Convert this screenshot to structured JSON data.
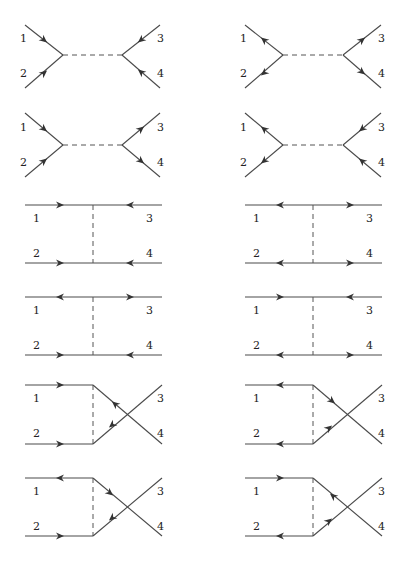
{
  "figure": {
    "width": 403,
    "height": 564,
    "colors": {
      "line": "#4a4a4a",
      "arrow": "#333333",
      "label": "#222222"
    },
    "diagrams": [
      {
        "id": "s-left-1",
        "channel": "s",
        "lines": [
          [
            25,
            25,
            63,
            55
          ],
          [
            25,
            88,
            63,
            55
          ],
          [
            63,
            55,
            122,
            55,
            "dash"
          ],
          [
            122,
            55,
            160,
            25
          ],
          [
            122,
            55,
            160,
            88
          ]
        ],
        "arrows": [
          [
            44,
            40,
            1,
            1
          ],
          [
            44,
            73,
            1,
            -1
          ],
          [
            141,
            40,
            -1,
            1
          ],
          [
            141,
            72,
            -1,
            -1
          ]
        ],
        "labels": [
          {
            "t": "1",
            "x": 20,
            "y": 42
          },
          {
            "t": "2",
            "x": 20,
            "y": 77
          },
          {
            "t": "3",
            "x": 157,
            "y": 42
          },
          {
            "t": "4",
            "x": 157,
            "y": 77
          }
        ]
      },
      {
        "id": "s-right-1",
        "channel": "s",
        "lines": [
          [
            245,
            25,
            283,
            55
          ],
          [
            245,
            88,
            283,
            55
          ],
          [
            283,
            55,
            343,
            55,
            "dash"
          ],
          [
            343,
            55,
            381,
            25
          ],
          [
            343,
            55,
            381,
            88
          ]
        ],
        "arrows": [
          [
            264,
            40,
            -1,
            -1
          ],
          [
            264,
            73,
            -1,
            1
          ],
          [
            362,
            40,
            1,
            -1
          ],
          [
            362,
            72,
            1,
            1
          ]
        ],
        "labels": [
          {
            "t": "1",
            "x": 240,
            "y": 42
          },
          {
            "t": "2",
            "x": 240,
            "y": 77
          },
          {
            "t": "3",
            "x": 378,
            "y": 42
          },
          {
            "t": "4",
            "x": 378,
            "y": 77
          }
        ]
      },
      {
        "id": "s-left-2",
        "channel": "s",
        "lines": [
          [
            25,
            113,
            63,
            145
          ],
          [
            25,
            177,
            63,
            145
          ],
          [
            63,
            145,
            122,
            145,
            "dash"
          ],
          [
            122,
            145,
            160,
            113
          ],
          [
            122,
            145,
            160,
            177
          ]
        ],
        "arrows": [
          [
            44,
            129,
            1,
            1
          ],
          [
            44,
            161,
            1,
            -1
          ],
          [
            141,
            129,
            1,
            -1
          ],
          [
            141,
            161,
            1,
            1
          ]
        ],
        "labels": [
          {
            "t": "1",
            "x": 20,
            "y": 131
          },
          {
            "t": "2",
            "x": 20,
            "y": 166
          },
          {
            "t": "3",
            "x": 157,
            "y": 131
          },
          {
            "t": "4",
            "x": 157,
            "y": 166
          }
        ]
      },
      {
        "id": "s-right-2",
        "channel": "s",
        "lines": [
          [
            245,
            113,
            283,
            145
          ],
          [
            245,
            177,
            283,
            145
          ],
          [
            283,
            145,
            343,
            145,
            "dash"
          ],
          [
            343,
            145,
            381,
            113
          ],
          [
            343,
            145,
            381,
            177
          ]
        ],
        "arrows": [
          [
            264,
            129,
            -1,
            -1
          ],
          [
            264,
            161,
            -1,
            1
          ],
          [
            362,
            129,
            -1,
            1
          ],
          [
            362,
            161,
            -1,
            -1
          ]
        ],
        "labels": [
          {
            "t": "1",
            "x": 240,
            "y": 131
          },
          {
            "t": "2",
            "x": 240,
            "y": 166
          },
          {
            "t": "3",
            "x": 378,
            "y": 131
          },
          {
            "t": "4",
            "x": 378,
            "y": 166
          }
        ]
      },
      {
        "id": "t-left-1",
        "channel": "t",
        "lines": [
          [
            25,
            205,
            162,
            205
          ],
          [
            25,
            263,
            162,
            263
          ],
          [
            93,
            205,
            93,
            263,
            "dash"
          ]
        ],
        "harrows": [
          [
            60,
            205,
            1
          ],
          [
            130,
            205,
            -1
          ],
          [
            60,
            263,
            1
          ],
          [
            130,
            263,
            -1
          ]
        ],
        "labels": [
          {
            "t": "1",
            "x": 33,
            "y": 222
          },
          {
            "t": "3",
            "x": 146,
            "y": 222
          },
          {
            "t": "2",
            "x": 33,
            "y": 257
          },
          {
            "t": "4",
            "x": 146,
            "y": 257
          }
        ]
      },
      {
        "id": "t-right-1",
        "channel": "t",
        "lines": [
          [
            245,
            205,
            382,
            205
          ],
          [
            245,
            263,
            382,
            263
          ],
          [
            313,
            205,
            313,
            263,
            "dash"
          ]
        ],
        "harrows": [
          [
            280,
            205,
            -1
          ],
          [
            350,
            205,
            1
          ],
          [
            280,
            263,
            -1
          ],
          [
            350,
            263,
            1
          ]
        ],
        "labels": [
          {
            "t": "1",
            "x": 253,
            "y": 222
          },
          {
            "t": "3",
            "x": 366,
            "y": 222
          },
          {
            "t": "2",
            "x": 253,
            "y": 257
          },
          {
            "t": "4",
            "x": 366,
            "y": 257
          }
        ]
      },
      {
        "id": "t-left-2",
        "channel": "t",
        "lines": [
          [
            25,
            297,
            162,
            297
          ],
          [
            25,
            355,
            162,
            355
          ],
          [
            93,
            297,
            93,
            355,
            "dash"
          ]
        ],
        "harrows": [
          [
            60,
            297,
            -1
          ],
          [
            130,
            297,
            1
          ],
          [
            60,
            355,
            1
          ],
          [
            130,
            355,
            -1
          ]
        ],
        "labels": [
          {
            "t": "1",
            "x": 33,
            "y": 314
          },
          {
            "t": "3",
            "x": 146,
            "y": 314
          },
          {
            "t": "2",
            "x": 33,
            "y": 349
          },
          {
            "t": "4",
            "x": 146,
            "y": 349
          }
        ]
      },
      {
        "id": "t-right-2",
        "channel": "t",
        "lines": [
          [
            245,
            297,
            382,
            297
          ],
          [
            245,
            355,
            382,
            355
          ],
          [
            313,
            297,
            313,
            355,
            "dash"
          ]
        ],
        "harrows": [
          [
            280,
            297,
            1
          ],
          [
            350,
            297,
            -1
          ],
          [
            280,
            355,
            -1
          ],
          [
            350,
            355,
            1
          ]
        ],
        "labels": [
          {
            "t": "1",
            "x": 253,
            "y": 314
          },
          {
            "t": "3",
            "x": 366,
            "y": 314
          },
          {
            "t": "2",
            "x": 253,
            "y": 349
          },
          {
            "t": "4",
            "x": 366,
            "y": 349
          }
        ]
      },
      {
        "id": "u-left-1",
        "channel": "u",
        "lines": [
          [
            25,
            385,
            93,
            385
          ],
          [
            25,
            444,
            93,
            444
          ],
          [
            93,
            385,
            93,
            444,
            "dash"
          ],
          [
            93,
            385,
            162,
            444
          ],
          [
            93,
            444,
            162,
            385
          ]
        ],
        "harrows": [
          [
            60,
            385,
            1
          ],
          [
            60,
            444,
            1
          ]
        ],
        "arrows": [
          [
            115,
            404,
            -1,
            -1
          ],
          [
            112,
            425,
            -1,
            1
          ]
        ],
        "labels": [
          {
            "t": "1",
            "x": 33,
            "y": 402
          },
          {
            "t": "3",
            "x": 157,
            "y": 402
          },
          {
            "t": "2",
            "x": 33,
            "y": 437
          },
          {
            "t": "4",
            "x": 157,
            "y": 437
          }
        ]
      },
      {
        "id": "u-right-1",
        "channel": "u",
        "lines": [
          [
            245,
            385,
            313,
            385
          ],
          [
            245,
            444,
            313,
            444
          ],
          [
            313,
            385,
            313,
            444,
            "dash"
          ],
          [
            313,
            385,
            382,
            444
          ],
          [
            313,
            444,
            382,
            385
          ]
        ],
        "harrows": [
          [
            280,
            385,
            -1
          ],
          [
            280,
            444,
            -1
          ]
        ],
        "arrows": [
          [
            332,
            401,
            1,
            1
          ],
          [
            329,
            428,
            1,
            -1
          ]
        ],
        "labels": [
          {
            "t": "1",
            "x": 253,
            "y": 402
          },
          {
            "t": "3",
            "x": 378,
            "y": 402
          },
          {
            "t": "2",
            "x": 253,
            "y": 437
          },
          {
            "t": "4",
            "x": 378,
            "y": 437
          }
        ]
      },
      {
        "id": "u-left-2",
        "channel": "u",
        "lines": [
          [
            25,
            478,
            93,
            478
          ],
          [
            25,
            536,
            93,
            536
          ],
          [
            93,
            478,
            93,
            536,
            "dash"
          ],
          [
            93,
            478,
            162,
            536
          ],
          [
            93,
            536,
            162,
            478
          ]
        ],
        "harrows": [
          [
            60,
            478,
            -1
          ],
          [
            60,
            536,
            1
          ]
        ],
        "arrows": [
          [
            110,
            493,
            1,
            1
          ],
          [
            112,
            518,
            -1,
            1
          ]
        ],
        "labels": [
          {
            "t": "1",
            "x": 33,
            "y": 495
          },
          {
            "t": "3",
            "x": 157,
            "y": 495
          },
          {
            "t": "2",
            "x": 33,
            "y": 530
          },
          {
            "t": "4",
            "x": 157,
            "y": 530
          }
        ]
      },
      {
        "id": "u-right-2",
        "channel": "u",
        "lines": [
          [
            245,
            478,
            313,
            478
          ],
          [
            245,
            536,
            313,
            536
          ],
          [
            313,
            478,
            313,
            536,
            "dash"
          ],
          [
            313,
            478,
            382,
            536
          ],
          [
            313,
            536,
            382,
            478
          ]
        ],
        "harrows": [
          [
            280,
            478,
            1
          ],
          [
            280,
            536,
            -1
          ]
        ],
        "arrows": [
          [
            333,
            496,
            -1,
            -1
          ],
          [
            329,
            521,
            1,
            -1
          ]
        ],
        "labels": [
          {
            "t": "1",
            "x": 253,
            "y": 495
          },
          {
            "t": "3",
            "x": 378,
            "y": 495
          },
          {
            "t": "2",
            "x": 253,
            "y": 530
          },
          {
            "t": "4",
            "x": 378,
            "y": 530
          }
        ]
      }
    ]
  }
}
